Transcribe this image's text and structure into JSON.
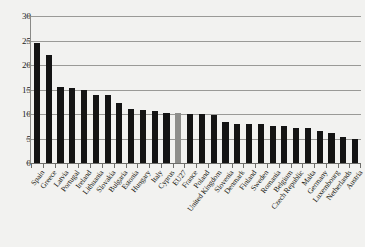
{
  "chart_title": "",
  "chart_data": {
    "type": "bar",
    "title": "",
    "subtitle": "",
    "xlabel": "",
    "ylabel": "",
    "ylim": [
      0,
      30
    ],
    "yticks": [
      0,
      5,
      10,
      15,
      20,
      25,
      30
    ],
    "ytick_labels": [
      "0",
      "5",
      "10",
      "15",
      "20",
      "25",
      "30"
    ],
    "grid": true,
    "grid_axis": "y",
    "legend": false,
    "legend_position": "none",
    "orientation": "vertical",
    "sorted": "descending",
    "highlight_category": "EU27",
    "colors": {
      "bar": "#141414",
      "highlight_bar": "#8e8e8b",
      "background": "#f2f2f0",
      "gridline": "#9a9a97",
      "axis": "#6e6e6b",
      "text": "#16160f"
    },
    "categories": [
      "Spain",
      "Greece",
      "Latvia",
      "Portugal",
      "Ireland",
      "Lithuania",
      "Slovakia",
      "Bulgaria",
      "Estonia",
      "Hungary",
      "Italy",
      "Cyprus",
      "EU27",
      "France",
      "Poland",
      "United Kingdom",
      "Slovenia",
      "Denmark",
      "Finland",
      "Sweden",
      "Romania",
      "Belgium",
      "Czech Republic",
      "Malta",
      "Germany",
      "Luxembourg",
      "Netherlands",
      "Austria"
    ],
    "values": [
      24.5,
      22.1,
      15.5,
      15.3,
      15.0,
      13.9,
      13.9,
      12.2,
      11.1,
      10.8,
      10.6,
      10.3,
      10.2,
      10.1,
      10.0,
      9.9,
      8.4,
      8.0,
      7.9,
      7.9,
      7.6,
      7.5,
      7.2,
      7.1,
      6.6,
      6.1,
      5.4,
      4.8
    ]
  }
}
